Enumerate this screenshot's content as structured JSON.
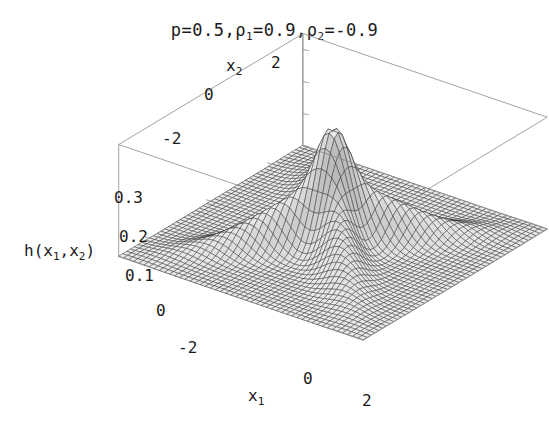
{
  "figure": {
    "title_parts": {
      "p_symbol": "p",
      "eq": "=",
      "p_value": "0.5",
      "comma": ",",
      "rho_symbol": "ρ",
      "rho1_sub": "1",
      "rho1_value": "0.9",
      "rho2_sub": "2",
      "rho2_value": "-0.9"
    },
    "title_text": "p=0.5,ρ1=0.9,ρ2=-0.9",
    "axes": {
      "x1": {
        "label_base": "x",
        "label_sub": "1",
        "ticks": [
          "-2",
          "0",
          "2"
        ],
        "min": -3,
        "max": 3
      },
      "x2": {
        "label_base": "x",
        "label_sub": "2",
        "ticks": [
          "-2",
          "0",
          "2"
        ],
        "min": -3,
        "max": 3
      },
      "z": {
        "label_base": "h",
        "label_open": "(",
        "label_x": "x",
        "label_sub1": "1",
        "label_comma": ",",
        "label_sub2": "2",
        "label_close": ")",
        "label_text": "h(x1,x2)",
        "ticks": [
          "0",
          "0.1",
          "0.2",
          "0.3"
        ],
        "min": 0,
        "max": 0.35
      }
    },
    "colors": {
      "frame": "#8a8a8a",
      "mesh": "#2b2b2b",
      "surface_light": "#f2f2f2",
      "surface_dark": "#555555",
      "text": "#1a1a1a",
      "background": "#ffffff"
    }
  },
  "chart_data": {
    "type": "surface",
    "title": "p=0.5,ρ1=0.9,ρ2=-0.9",
    "xlabel": "x1",
    "ylabel": "x2",
    "zlabel": "h(x1,x2)",
    "xlim": [
      -3,
      3
    ],
    "ylim": [
      -3,
      3
    ],
    "zlim": [
      0,
      0.35
    ],
    "xticks": [
      -2,
      0,
      2
    ],
    "yticks": [
      -2,
      0,
      2
    ],
    "zticks": [
      0,
      0.1,
      0.2,
      0.3
    ],
    "grid": false,
    "legend": false,
    "render": "wireframe-mesh",
    "mesh_n": 48,
    "function": "mixture of two bivariate normal densities",
    "formula": "h(x1,x2) = p*N(x1,x2;0,0,1,1,rho1) + (1-p)*N(x1,x2;0,0,1,1,rho2)",
    "parameters": {
      "p": 0.5,
      "rho1": 0.9,
      "rho2": -0.9,
      "mu1": 0,
      "mu2": 0,
      "sigma1": 1,
      "sigma2": 1
    },
    "peak_value": 0.33,
    "peak_location": [
      0,
      0
    ],
    "features": [
      "sharp central peak at origin",
      "ridge along x2 = x1 direction from rho1 = 0.9 component",
      "ridge along x2 = -x1 direction from rho2 = -0.9 component",
      "X-shaped crossing ridges forming saddle regions between them"
    ],
    "view": {
      "azimuth_deg": -37,
      "elevation_deg": 27
    }
  }
}
